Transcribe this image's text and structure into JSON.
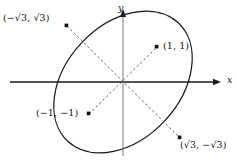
{
  "figure": {
    "type": "math-diagram",
    "background_color": "#ffffff",
    "stroke_color": "#1a1a1a",
    "dashed_color": "#555555"
  },
  "axes": {
    "x_label": "x",
    "y_label": "y",
    "origin_px": {
      "x": 123,
      "y": 82
    },
    "x_axis_px": {
      "x1": 10,
      "y1": 82,
      "x2": 218,
      "y2": 82
    },
    "y_axis_px": {
      "x1": 123,
      "y1": 12,
      "x2": 123,
      "y2": 156
    },
    "x_arrow": "right",
    "y_arrow": "up"
  },
  "ellipse": {
    "center_px": {
      "x": 123,
      "y": 82
    },
    "semi_major_px": 81,
    "semi_minor_px": 57,
    "rotation_deg": -47,
    "stroke_width": 1.2
  },
  "points": [
    {
      "id": "upper-left",
      "label": "(−√3, √3)",
      "label_parts": {
        "x": "−√3",
        "y": "√3"
      },
      "px": {
        "x": 67,
        "y": 26
      }
    },
    {
      "id": "upper-right",
      "label": "(1, 1)",
      "label_parts": {
        "x": "1",
        "y": "1"
      },
      "px": {
        "x": 157,
        "y": 47
      }
    },
    {
      "id": "lower-left",
      "label": "(−1, −1)",
      "label_parts": {
        "x": "−1",
        "y": "−1"
      },
      "px": {
        "x": 89,
        "y": 114
      }
    },
    {
      "id": "lower-right",
      "label": "(√3, −√3)",
      "label_parts": {
        "x": "√3",
        "y": "−√3"
      },
      "px": {
        "x": 180,
        "y": 138
      }
    }
  ],
  "dashed_segments": [
    {
      "id": "major-axis",
      "from": "upper-left",
      "to": "lower-right"
    },
    {
      "id": "minor-axis",
      "from": "lower-left",
      "to": "upper-right"
    }
  ]
}
